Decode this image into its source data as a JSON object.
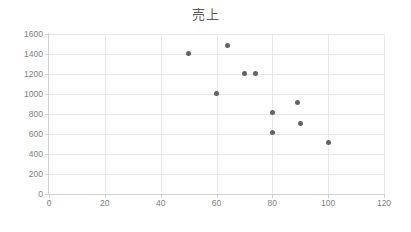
{
  "chart_data": {
    "type": "scatter",
    "title": "売上",
    "xlabel": "",
    "ylabel": "",
    "xlim": [
      0,
      120
    ],
    "ylim": [
      0,
      1600
    ],
    "xticks": [
      0,
      20,
      40,
      60,
      80,
      100,
      120
    ],
    "yticks": [
      0,
      200,
      400,
      600,
      800,
      1000,
      1200,
      1400,
      1600
    ],
    "grid": true,
    "legend": false,
    "marker_color": "#636363",
    "series": [
      {
        "name": "売上",
        "points": [
          {
            "x": 50,
            "y": 1410
          },
          {
            "x": 60,
            "y": 1010
          },
          {
            "x": 64,
            "y": 1490
          },
          {
            "x": 70,
            "y": 1210
          },
          {
            "x": 74,
            "y": 1210
          },
          {
            "x": 80,
            "y": 820
          },
          {
            "x": 80,
            "y": 620
          },
          {
            "x": 89,
            "y": 920
          },
          {
            "x": 90,
            "y": 710
          },
          {
            "x": 100,
            "y": 520
          }
        ]
      }
    ]
  },
  "colors": {
    "marker": "#636363",
    "grid": "#e8e8e8",
    "axis": "#d0d0d0",
    "text": "#808080",
    "title": "#595959",
    "background": "#ffffff"
  }
}
